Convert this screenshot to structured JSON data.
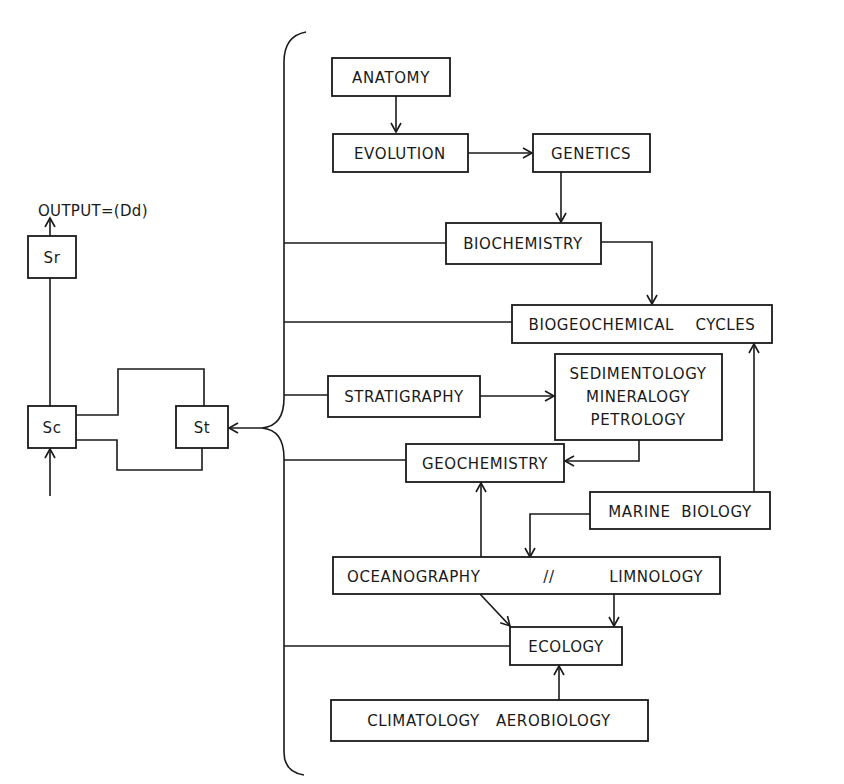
{
  "diagram": {
    "output_label": "OUTPUT=(Dd)",
    "left_system": {
      "sr": "Sr",
      "sc": "Sc",
      "st": "St"
    },
    "nodes": {
      "anatomy": "ANATOMY",
      "evolution": "EVOLUTION",
      "genetics": "GENETICS",
      "biochemistry": "BIOCHEMISTRY",
      "biogeochemical_cycles": "BIOGEOCHEMICAL    CYCLES",
      "stratigraphy": "STRATIGRAPHY",
      "sedimentology": [
        "SEDIMENTOLOGY",
        "MINERALOGY",
        "PETROLOGY"
      ],
      "geochemistry": "GEOCHEMISTRY",
      "marine_biology": "MARINE  BIOLOGY",
      "oceanography": "OCEANOGRAPHY",
      "separator": "//",
      "limnology": "LIMNOLOGY",
      "ecology": "ECOLOGY",
      "climatology_aerobiology": "CLIMATOLOGY   AEROBIOLOGY"
    },
    "edges": [
      [
        "anatomy",
        "evolution"
      ],
      [
        "evolution",
        "genetics"
      ],
      [
        "genetics",
        "biochemistry"
      ],
      [
        "biochemistry",
        "biogeochemical_cycles"
      ],
      [
        "stratigraphy",
        "sedimentology"
      ],
      [
        "sedimentology",
        "geochemistry"
      ],
      [
        "marine_biology",
        "biogeochemical_cycles"
      ],
      [
        "marine_biology",
        "oceanography"
      ],
      [
        "oceanography",
        "geochemistry"
      ],
      [
        "oceanography",
        "ecology"
      ],
      [
        "limnology",
        "ecology"
      ],
      [
        "climatology_aerobiology",
        "ecology"
      ],
      [
        "brace",
        "st"
      ],
      [
        "sc",
        "sr"
      ],
      [
        "sr",
        "output"
      ]
    ]
  }
}
